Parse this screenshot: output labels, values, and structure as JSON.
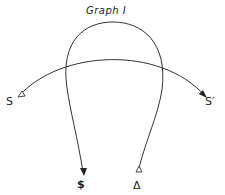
{
  "diagram": {
    "title": "Graph I",
    "labels": {
      "source_left": "S",
      "source_right": "S′",
      "leg_left_end": "$",
      "leg_right_end": "Δ"
    },
    "elements": [
      {
        "type": "loop",
        "description": "closed-top loop with two legs descending; left leg ends with filled arrow pointing down to $, right leg ends with open triangle marker above Δ"
      },
      {
        "type": "arc",
        "description": "directed arc from S (open triangle tail) to S′ (arrowhead), crossing the loop twice"
      }
    ],
    "colors": {
      "stroke": "#333333",
      "background": "#ffffff"
    }
  }
}
